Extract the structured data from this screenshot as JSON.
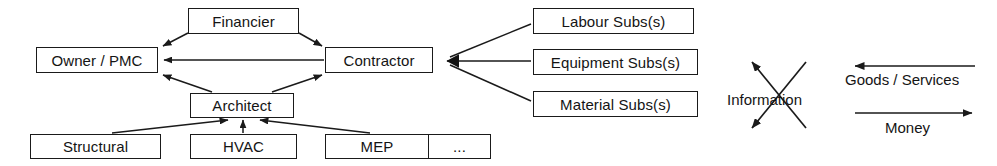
{
  "diagram": {
    "background_color": "#ffffff",
    "stroke_color": "#1a1a1a",
    "text_color": "#141414",
    "nodes": {
      "owner": "Owner / PMC",
      "financier": "Financier",
      "contractor": "Contractor",
      "architect": "Architect",
      "structural": "Structural",
      "hvac": "HVAC",
      "mep": "MEP",
      "etc": "...",
      "labour_subs": "Labour Subs(s)",
      "equipment_subs": "Equipment Subs(s)",
      "material_subs": "Material Subs(s)"
    },
    "legend": {
      "information": "Information",
      "goods_services": "Goods / Services",
      "money": "Money",
      "information_icon": "crossed-double-arrow-icon",
      "goods_services_icon": "left-arrow-icon",
      "money_icon": "right-arrow-icon"
    },
    "edges": [
      {
        "from": "financier",
        "to": "owner",
        "arrow": "to"
      },
      {
        "from": "financier",
        "to": "contractor",
        "arrow": "to"
      },
      {
        "from": "contractor",
        "to": "owner",
        "arrow": "to"
      },
      {
        "from": "architect",
        "to": "owner",
        "arrow": "to"
      },
      {
        "from": "architect",
        "to": "contractor",
        "arrow": "to"
      },
      {
        "from": "structural",
        "to": "architect",
        "arrow": "to"
      },
      {
        "from": "hvac",
        "to": "architect",
        "arrow": "to"
      },
      {
        "from": "mep",
        "to": "architect",
        "arrow": "to"
      },
      {
        "from": "labour_subs",
        "to": "contractor",
        "arrow": "to"
      },
      {
        "from": "equipment_subs",
        "to": "contractor",
        "arrow": "to"
      },
      {
        "from": "material_subs",
        "to": "contractor",
        "arrow": "to"
      }
    ]
  }
}
